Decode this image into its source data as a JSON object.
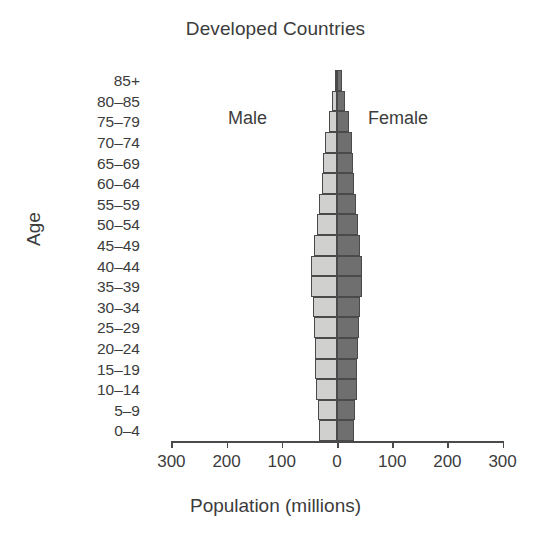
{
  "chart_data": {
    "type": "bar",
    "subtype": "population-pyramid",
    "title": "Developed Countries",
    "xlabel": "Population (millions)",
    "ylabel": "Age",
    "grid": false,
    "legend_position": "inside-plot",
    "xlim": [
      -300,
      300
    ],
    "xticks": [
      -300,
      -200,
      -100,
      0,
      100,
      200,
      300
    ],
    "xtick_labels": [
      "300",
      "200",
      "100",
      "0",
      "100",
      "200",
      "300"
    ],
    "categories": [
      "0–4",
      "5–9",
      "10–14",
      "15–19",
      "20–24",
      "25–29",
      "30–34",
      "35–39",
      "40–44",
      "45–49",
      "50–54",
      "55–59",
      "60–64",
      "65–69",
      "70–74",
      "75–79",
      "80–85",
      "85+"
    ],
    "series": [
      {
        "name": "Male",
        "direction": "left",
        "color": "#d0d0ce",
        "values": [
          33,
          35,
          38,
          39,
          40,
          41,
          43,
          48,
          47,
          42,
          37,
          32,
          28,
          25,
          21,
          15,
          9,
          4
        ]
      },
      {
        "name": "Female",
        "direction": "right",
        "color": "#6f6f6f",
        "values": [
          31,
          33,
          36,
          37,
          38,
          39,
          41,
          46,
          46,
          42,
          38,
          34,
          31,
          29,
          27,
          22,
          15,
          9
        ]
      }
    ],
    "annotations": [
      {
        "text": "Male",
        "series": "Male"
      },
      {
        "text": "Female",
        "series": "Female"
      }
    ],
    "colors": {
      "male": "#d0d0ce",
      "female": "#6f6f6f",
      "outline": "#4a4a4a",
      "text": "#3c3c3c",
      "background": "#ffffff"
    }
  }
}
